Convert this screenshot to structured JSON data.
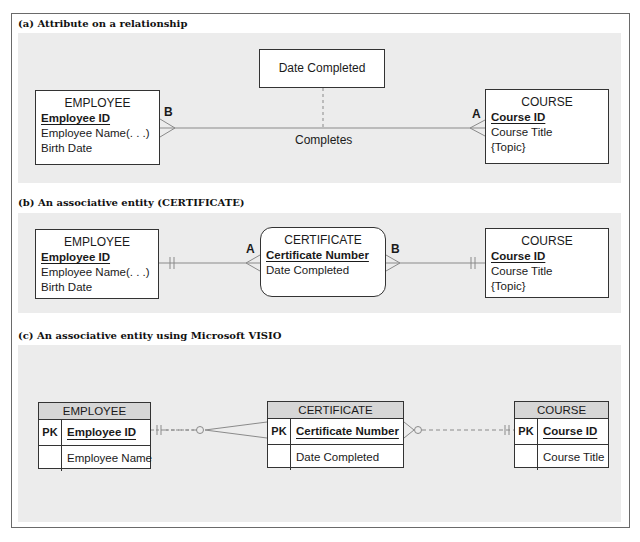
{
  "panels": {
    "a": {
      "caption": "(a) Attribute on a relationship",
      "employee": {
        "title": "EMPLOYEE",
        "pk": "Employee ID",
        "attrs": [
          "Employee Name(. . .)",
          "Birth Date"
        ]
      },
      "course": {
        "title": "COURSE",
        "pk": "Course ID",
        "attrs": [
          "Course Title",
          "{Topic}"
        ]
      },
      "relationship_attribute": "Date Completed",
      "relationship_name": "Completes",
      "label_employee_end": "B",
      "label_course_end": "A"
    },
    "b": {
      "caption": "(b) An associative entity (CERTIFICATE)",
      "employee": {
        "title": "EMPLOYEE",
        "pk": "Employee ID",
        "attrs": [
          "Employee Name(. . .)",
          "Birth Date"
        ]
      },
      "certificate": {
        "title": "CERTIFICATE",
        "pk": "Certificate Number",
        "attrs": [
          "Date Completed"
        ]
      },
      "course": {
        "title": "COURSE",
        "pk": "Course ID",
        "attrs": [
          "Course Title",
          "{Topic}"
        ]
      },
      "label_left": "A",
      "label_right": "B"
    },
    "c": {
      "caption": "(c) An associative entity using Microsoft VISIO",
      "employee": {
        "title": "EMPLOYEE",
        "pk_tag": "PK",
        "pk": "Employee ID",
        "attrs": [
          "Employee Name"
        ]
      },
      "certificate": {
        "title": "CERTIFICATE",
        "pk_tag": "PK",
        "pk": "Certificate Number",
        "attrs": [
          "Date Completed"
        ]
      },
      "course": {
        "title": "COURSE",
        "pk_tag": "PK",
        "pk": "Course ID",
        "attrs": [
          "Course Title"
        ]
      }
    }
  },
  "colors": {
    "panel_bg": "#ececec",
    "line": "#888888",
    "border": "#333333",
    "visio_header": "#d6d6d6"
  }
}
